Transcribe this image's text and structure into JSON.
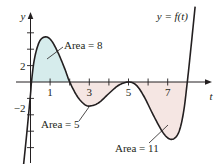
{
  "chart_data": {
    "type": "line",
    "title": "",
    "curve_label": "y = f(t)",
    "xlabel": "t",
    "ylabel": "y",
    "xlim": [
      -0.6,
      9.3
    ],
    "ylim": [
      -10.5,
      9.8
    ],
    "x_ticks": [
      1,
      2,
      3,
      4,
      5,
      6,
      7
    ],
    "x_tick_labels": [
      {
        "value": 1,
        "label": "1"
      },
      {
        "value": 3,
        "label": "3"
      },
      {
        "value": 5,
        "label": "5"
      },
      {
        "value": 7,
        "label": "7"
      }
    ],
    "y_ticks": [
      -8,
      -6,
      -4,
      -2,
      2,
      4,
      6
    ],
    "y_tick_labels": [
      {
        "value": 2,
        "label": "2"
      },
      {
        "value": -2,
        "label": "−2"
      }
    ],
    "series": [
      {
        "name": "f(t)",
        "points": [
          [
            -0.35,
            -10.0
          ],
          [
            -0.2,
            -6.5
          ],
          [
            0.0,
            -1.5
          ],
          [
            0.05,
            0.0
          ],
          [
            0.2,
            2.8
          ],
          [
            0.45,
            4.9
          ],
          [
            0.75,
            5.5
          ],
          [
            1.05,
            5.1
          ],
          [
            1.4,
            3.6
          ],
          [
            1.75,
            1.6
          ],
          [
            2.0,
            0.0
          ],
          [
            2.4,
            -1.8
          ],
          [
            2.8,
            -2.8
          ],
          [
            3.1,
            -2.9
          ],
          [
            3.5,
            -2.5
          ],
          [
            4.0,
            -1.4
          ],
          [
            4.5,
            -0.4
          ],
          [
            5.0,
            0.0
          ],
          [
            5.4,
            -0.4
          ],
          [
            5.8,
            -1.8
          ],
          [
            6.3,
            -4.2
          ],
          [
            6.8,
            -6.3
          ],
          [
            7.2,
            -7.0
          ],
          [
            7.55,
            -6.2
          ],
          [
            7.8,
            -3.8
          ],
          [
            8.0,
            0.0
          ],
          [
            8.2,
            4.5
          ],
          [
            8.4,
            9.2
          ]
        ]
      }
    ],
    "shaded_regions": [
      {
        "from": 0.05,
        "to": 2.0,
        "sign": "positive",
        "area": 8,
        "label": "Area = 8",
        "color": "#d6ecec"
      },
      {
        "from": 2.0,
        "to": 5.0,
        "sign": "negative",
        "area": 5,
        "label": "Area = 5",
        "color": "#f5e6e3"
      },
      {
        "from": 5.0,
        "to": 8.0,
        "sign": "negative",
        "area": 11,
        "label": "Area = 11",
        "color": "#f5e6e3"
      }
    ],
    "grid": false,
    "legend": "none"
  },
  "colors": {
    "curve": "#231f20",
    "axis": "#231f20",
    "positive_fill": "#d6ecec",
    "negative_fill": "#f5e6e3"
  }
}
